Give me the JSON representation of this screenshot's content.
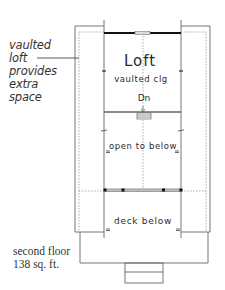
{
  "annotation": {
    "lines": [
      "vaulted",
      "loft",
      "provides",
      "extra",
      "space"
    ]
  },
  "rooms": {
    "loft": "Loft",
    "loft_note": "vaulted clg",
    "stair": "Dn",
    "open": "open to below",
    "deck": "deck below"
  },
  "caption": {
    "line1": "second floor",
    "line2": "138 sq. ft."
  },
  "colors": {
    "line": "#555555",
    "wall": "#111111",
    "dotted": "#888888",
    "background": "#ffffff"
  }
}
